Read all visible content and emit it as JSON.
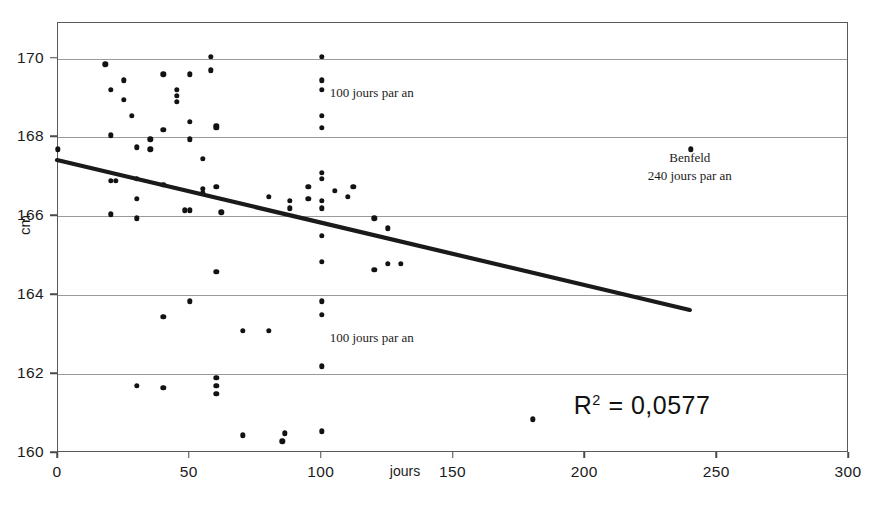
{
  "chart_data": {
    "type": "scatter",
    "title": "",
    "xlabel": "jours",
    "ylabel": "cm",
    "xlim": [
      0,
      300
    ],
    "ylim": [
      160,
      170.9
    ],
    "xticks": [
      0,
      50,
      100,
      150,
      200,
      250,
      300
    ],
    "yticks": [
      160,
      162,
      164,
      166,
      168,
      170
    ],
    "grid": true,
    "legend": "none",
    "r_squared_label": "R2 = 0,0577",
    "r_squared_value": 0.0577,
    "trendline": {
      "type": "linear",
      "x_start": 0,
      "y_start": 167.4,
      "x_end": 240,
      "y_end": 163.6,
      "color": "#1a1a1a"
    },
    "annotations": [
      {
        "text": "100 jours par an",
        "x": 100,
        "y": 169.1
      },
      {
        "text": "100 jours par an",
        "x": 100,
        "y": 162.9
      },
      {
        "text": "Benfeld",
        "x": 240,
        "y": 167.45
      },
      {
        "text": "240 jours par an",
        "x": 240,
        "y": 167.0
      }
    ],
    "points": [
      [
        0,
        167.7
      ],
      [
        18,
        169.85
      ],
      [
        20,
        169.2
      ],
      [
        20,
        168.05
      ],
      [
        20,
        166.9
      ],
      [
        20,
        166.05
      ],
      [
        22,
        166.9
      ],
      [
        25,
        169.45
      ],
      [
        25,
        168.95
      ],
      [
        28,
        168.55
      ],
      [
        30,
        167.75
      ],
      [
        30,
        166.95
      ],
      [
        30,
        166.45
      ],
      [
        30,
        161.7
      ],
      [
        30,
        165.95
      ],
      [
        35,
        167.95
      ],
      [
        35,
        167.7
      ],
      [
        40,
        169.6
      ],
      [
        40,
        168.2
      ],
      [
        40,
        166.8
      ],
      [
        40,
        163.45
      ],
      [
        40,
        161.65
      ],
      [
        45,
        169.2
      ],
      [
        45,
        169.05
      ],
      [
        45,
        168.9
      ],
      [
        48,
        166.15
      ],
      [
        50,
        169.6
      ],
      [
        50,
        168.4
      ],
      [
        50,
        167.95
      ],
      [
        50,
        166.15
      ],
      [
        50,
        163.85
      ],
      [
        55,
        167.45
      ],
      [
        55,
        166.7
      ],
      [
        55,
        166.6
      ],
      [
        58,
        170.05
      ],
      [
        58,
        169.7
      ],
      [
        60,
        168.3
      ],
      [
        60,
        168.25
      ],
      [
        60,
        166.75
      ],
      [
        60,
        164.6
      ],
      [
        60,
        161.9
      ],
      [
        60,
        161.7
      ],
      [
        60,
        161.5
      ],
      [
        62,
        166.1
      ],
      [
        70,
        163.1
      ],
      [
        70,
        160.45
      ],
      [
        80,
        166.5
      ],
      [
        80,
        163.1
      ],
      [
        85,
        160.3
      ],
      [
        86,
        160.5
      ],
      [
        88,
        166.4
      ],
      [
        88,
        166.2
      ],
      [
        95,
        166.45
      ],
      [
        95,
        166.75
      ],
      [
        100,
        170.05
      ],
      [
        100,
        169.45
      ],
      [
        100,
        169.2
      ],
      [
        100,
        168.55
      ],
      [
        100,
        168.25
      ],
      [
        100,
        167.1
      ],
      [
        100,
        166.95
      ],
      [
        100,
        166.4
      ],
      [
        100,
        166.2
      ],
      [
        100,
        165.5
      ],
      [
        100,
        164.85
      ],
      [
        100,
        163.85
      ],
      [
        100,
        163.5
      ],
      [
        100,
        162.2
      ],
      [
        100,
        160.55
      ],
      [
        105,
        166.65
      ],
      [
        110,
        166.5
      ],
      [
        112,
        166.75
      ],
      [
        120,
        165.95
      ],
      [
        120,
        164.65
      ],
      [
        125,
        165.7
      ],
      [
        125,
        164.8
      ],
      [
        130,
        164.8
      ],
      [
        180,
        160.85
      ],
      [
        240,
        167.7
      ]
    ]
  }
}
